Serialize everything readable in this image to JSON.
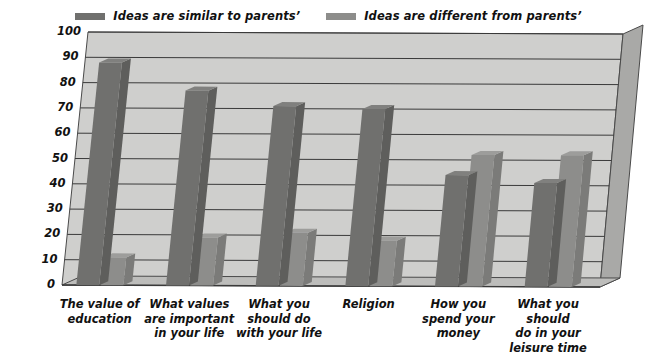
{
  "legend": {
    "entries": [
      {
        "label": "Ideas are similar to parents’",
        "swatch": "#70706e",
        "icon": "legend-swatch-icon"
      },
      {
        "label": "Ideas are different from parents’",
        "swatch": "#8d8d8b",
        "icon": "legend-swatch-icon"
      }
    ]
  },
  "colors": {
    "series_similar": "#70706e",
    "series_different": "#8d8d8b",
    "plot_background": "#cfcfcd",
    "side_wall": "#a9a9a7",
    "floor": "#bdbdbb",
    "gridline": "#3a3a3a",
    "text": "#111111",
    "page_background": "#ffffff"
  },
  "chart_data": {
    "type": "bar",
    "title": "",
    "xlabel": "",
    "ylabel": "",
    "ylim": [
      0,
      100
    ],
    "yticks": [
      0,
      10,
      20,
      30,
      40,
      50,
      60,
      70,
      80,
      90,
      100
    ],
    "grid": true,
    "legend_position": "top-center",
    "three_d": true,
    "categories": [
      "The value of\neducation",
      "What values\nare important\nin your life",
      "What you\nshould do\nwith your life",
      "Religion",
      "How you\nspend your\nmoney",
      "What you should\ndo in your\nleisure time"
    ],
    "series": [
      {
        "name": "Ideas are similar to parents’",
        "values": [
          88,
          77,
          71,
          70,
          44,
          41
        ]
      },
      {
        "name": "Ideas are different from parents’",
        "values": [
          11,
          19,
          21,
          18,
          52,
          52
        ]
      }
    ]
  }
}
